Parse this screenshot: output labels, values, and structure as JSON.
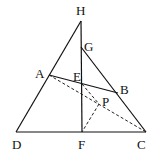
{
  "diagram": {
    "points": {
      "H": {
        "label": "H",
        "x": 81,
        "y": 21,
        "lx": 76,
        "ly": 15
      },
      "G": {
        "label": "G",
        "x": 81,
        "y": 47,
        "lx": 84,
        "ly": 51
      },
      "A": {
        "label": "A",
        "x": 49,
        "y": 75,
        "lx": 35,
        "ly": 78
      },
      "E": {
        "label": "E",
        "x": 82,
        "y": 84,
        "lx": 73,
        "ly": 81
      },
      "B": {
        "label": "B",
        "x": 118,
        "y": 93,
        "lx": 120,
        "ly": 94
      },
      "P": {
        "label": "P",
        "x": 99,
        "y": 104,
        "lx": 102,
        "ly": 106
      },
      "D": {
        "label": "D",
        "x": 16,
        "y": 132,
        "lx": 12,
        "ly": 149
      },
      "F": {
        "label": "F",
        "x": 82,
        "y": 132,
        "lx": 78,
        "ly": 149
      },
      "C": {
        "label": "C",
        "x": 146,
        "y": 132,
        "lx": 137,
        "ly": 149
      }
    },
    "solid_segments": [
      [
        "H",
        "D"
      ],
      [
        "H",
        "F"
      ],
      [
        "G",
        "C"
      ],
      [
        "D",
        "C"
      ],
      [
        "A",
        "B"
      ]
    ],
    "dashed_segments": [
      [
        "A",
        "C"
      ],
      [
        "E",
        "P"
      ],
      [
        "P",
        "F"
      ]
    ]
  }
}
